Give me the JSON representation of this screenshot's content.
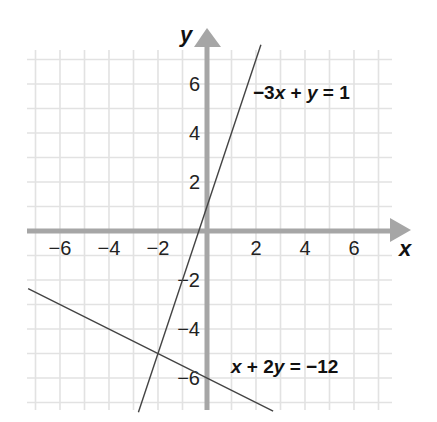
{
  "chart_data": {
    "type": "line",
    "title": "",
    "xlabel": "x",
    "ylabel": "y",
    "xlim": [
      -7,
      7
    ],
    "ylim": [
      -7,
      7
    ],
    "grid": true,
    "x_ticks": [
      -6,
      -4,
      -2,
      2,
      4,
      6
    ],
    "y_ticks": [
      6,
      4,
      2,
      -2,
      -4,
      -6
    ],
    "x_tick_labels": [
      "−6",
      "−4",
      "−2",
      "2",
      "4",
      "6"
    ],
    "y_tick_labels": [
      "6",
      "4",
      "2",
      "−2",
      "−4",
      "−6"
    ],
    "series": [
      {
        "name": "−3x + y = 1",
        "equation": "y = 3x + 1",
        "slope": 3,
        "intercept": 1,
        "x_range": [
          -2.8,
          2.2
        ],
        "color": "#444444"
      },
      {
        "name": "x + 2y = −12",
        "equation": "y = -0.5x - 6",
        "slope": -0.5,
        "intercept": -6,
        "x_range": [
          -7.3,
          2.7
        ],
        "color": "#444444"
      }
    ],
    "annotations": [
      {
        "text": "−3x + y = 1",
        "near": [
          3.5,
          6
        ]
      },
      {
        "text": "x + 2y = −12",
        "near": [
          4,
          -5.5
        ]
      }
    ],
    "intersection": [
      -2,
      -5
    ]
  },
  "labels": {
    "x_axis": "x",
    "y_axis": "y",
    "eq1": {
      "coef": "−3",
      "v1": "x",
      "mid": " + ",
      "v2": "y",
      "rhs": " = 1"
    },
    "eq2": {
      "v1": "x",
      "mid": " + 2",
      "v2": "y",
      "rhs": " = −12"
    }
  },
  "colors": {
    "grid": "#e2e2e2",
    "axis": "#a6a6a6",
    "line": "#444444",
    "text": "#222222"
  }
}
